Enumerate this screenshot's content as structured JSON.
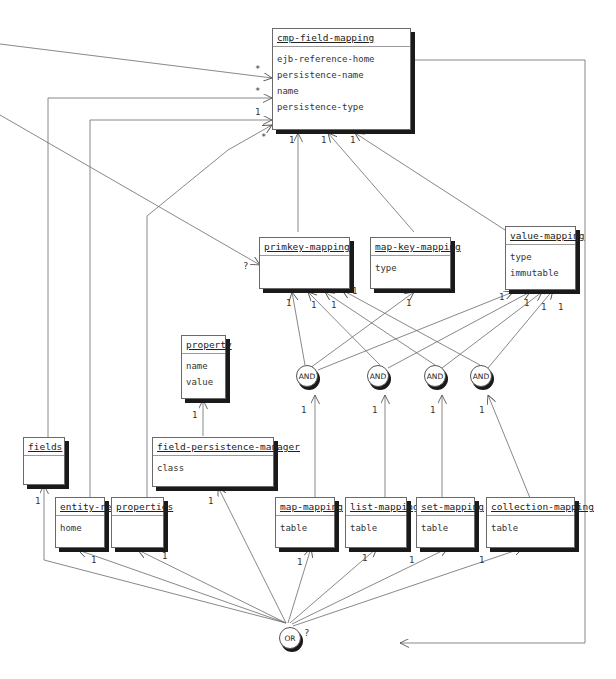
{
  "classes": {
    "cmp_field_mapping": {
      "name": "cmp-field-mapping",
      "attrs": [
        "ejb-reference-home",
        "persistence-name",
        "name",
        "persistence-type"
      ]
    },
    "primkey_mapping": {
      "name": "primkey-mapping",
      "attrs": []
    },
    "map_key_mapping": {
      "name": "map-key-mapping",
      "attrs": [
        "type"
      ]
    },
    "value_mapping": {
      "name": "value-mapping",
      "attrs": [
        "type",
        "immutable"
      ]
    },
    "property": {
      "name": "property",
      "attrs": [
        "name",
        "value"
      ]
    },
    "field_persistence_manager": {
      "name": "field-persistence-manager",
      "attrs": [
        "class"
      ]
    },
    "fields": {
      "name": "fields",
      "attrs": []
    },
    "entity_ref": {
      "name": "entity-ref",
      "attrs": [
        "home"
      ]
    },
    "properties": {
      "name": "properties",
      "attrs": []
    },
    "map_mapping": {
      "name": "map-mapping",
      "attrs": [
        "table"
      ]
    },
    "list_mapping": {
      "name": "list-mapping",
      "attrs": [
        "table"
      ]
    },
    "set_mapping": {
      "name": "set-mapping",
      "attrs": [
        "table"
      ]
    },
    "collection_mapping": {
      "name": "collection-mapping",
      "attrs": [
        "table"
      ]
    }
  },
  "nodes": {
    "and1": "AND",
    "and2": "AND",
    "and3": "AND",
    "and4": "AND",
    "or": "OR"
  },
  "multiplicities": {
    "star1": "*",
    "star2": "*",
    "one1": "1",
    "star3": "*",
    "cmp_b1": "1",
    "cmp_b2": "1",
    "cmp_b3": "1",
    "q_primkey": "?",
    "pk1": "1",
    "pk2": "1",
    "pk3": "1",
    "pk4": "1",
    "mk1": "1",
    "vm1": "1",
    "vm2": "1",
    "vm3": "1",
    "vm4": "1",
    "and1_b": "1",
    "and2_b": "1",
    "and3_b": "1",
    "and4_b": "1",
    "prop1": "1",
    "fpm1": "1",
    "fields1": "1",
    "er1": "1",
    "pr1": "1",
    "mm1": "1",
    "lm1": "1",
    "sm1": "1",
    "cm1": "1",
    "or_q": "?"
  }
}
